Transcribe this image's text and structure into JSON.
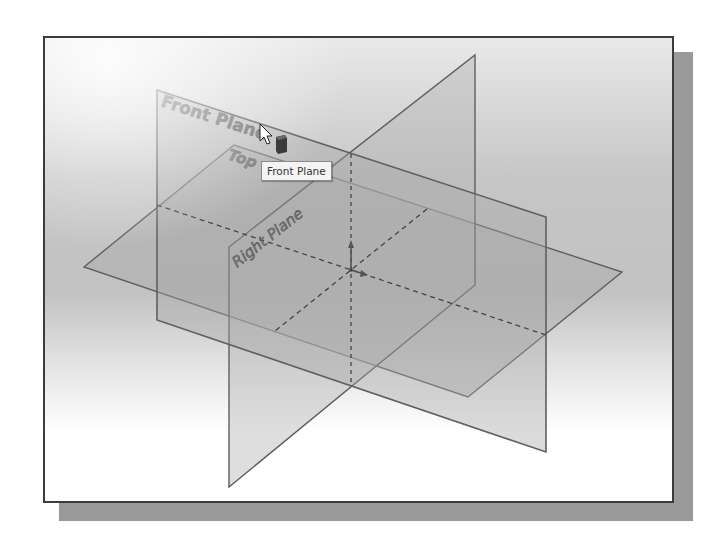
{
  "viewport": {
    "background": "gray-to-white gradient",
    "frame_color": "#3c3c3c",
    "shadow_color": "#9a9a9a"
  },
  "planes": [
    {
      "name": "Front Plane",
      "label": "Front Plane",
      "fill": "#b8b8b8",
      "edge": "#6a6a6a"
    },
    {
      "name": "Top Plane",
      "label": "Top",
      "fill": "#b0b0b0",
      "edge": "#6a6a6a"
    },
    {
      "name": "Right Plane",
      "label": "Right Plane",
      "fill": "#bcbcbc",
      "edge": "#6a6a6a"
    }
  ],
  "labels": {
    "front": "Front Plane",
    "top": "Top",
    "right": "Right Plane"
  },
  "tooltip": {
    "text": "Front Plane"
  },
  "cursor": {
    "icon": "arrow-cursor-with-plane-icon"
  },
  "origin": {
    "icon": "origin-triad-icon"
  }
}
